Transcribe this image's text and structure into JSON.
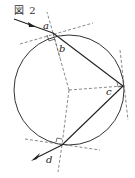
{
  "figure": {
    "title": "図 2",
    "labels": {
      "a": "a",
      "b": "b",
      "c": "c",
      "d": "d"
    },
    "colors": {
      "stroke": "#333333",
      "dashed": "#555555",
      "background": "#ffffff"
    }
  }
}
